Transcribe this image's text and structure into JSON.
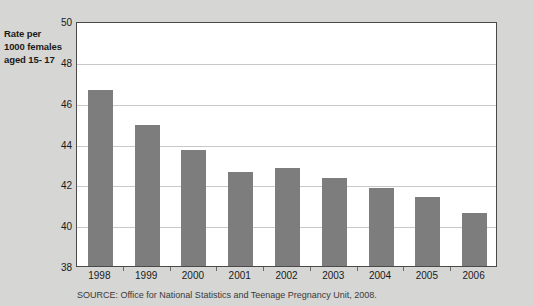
{
  "chart_data": {
    "type": "bar",
    "title": "",
    "xlabel": "",
    "ylabel": "Rate per 1000 females aged 15- 17",
    "ylabel_lines": [
      "Rate per",
      "1000 females",
      "aged 15- 17"
    ],
    "categories": [
      "1998",
      "1999",
      "2000",
      "2001",
      "2002",
      "2003",
      "2004",
      "2005",
      "2006"
    ],
    "values": [
      46.6,
      44.9,
      43.7,
      42.6,
      42.8,
      42.3,
      41.8,
      41.4,
      40.6
    ],
    "ylim": [
      38,
      50
    ],
    "yticks": [
      50,
      48,
      46,
      44,
      42,
      40,
      38
    ],
    "grid": true,
    "legend": false,
    "bar_color": "#7d7d7d",
    "plot_background": "#ffffff",
    "figure_background": "#d6d6d4",
    "series": [
      {
        "name": "Under-18 conception rate",
        "values": [
          46.6,
          44.9,
          43.7,
          42.6,
          42.8,
          42.3,
          41.8,
          41.4,
          40.6
        ]
      }
    ]
  },
  "source_note": "SOURCE: Office for National Statistics and Teenage Pregnancy Unit, 2008."
}
